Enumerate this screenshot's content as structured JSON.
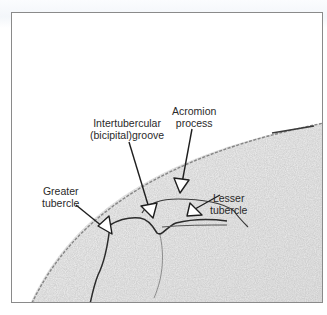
{
  "figure": {
    "labels": {
      "acromion": [
        "Acromion",
        "process"
      ],
      "groove": [
        "Intertubercular",
        "(bicipital)groove"
      ],
      "greater": [
        "Greater",
        "tubercle"
      ],
      "lesser": [
        "Lesser",
        "tubercle"
      ]
    },
    "colors": {
      "frame": "#8a8a8a",
      "ink": "#2a2a2a",
      "tissue": "#d9d9d9"
    }
  }
}
